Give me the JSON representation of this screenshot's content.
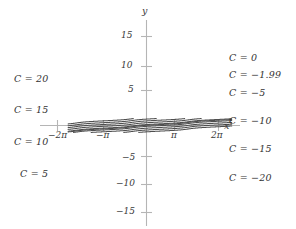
{
  "figure": {
    "axis_name_x": "x",
    "axis_name_y": "y",
    "axis_color": "#b0b0b0",
    "curve_color": "#4a4a4a",
    "background": "#ffffff"
  },
  "chart_data": {
    "type": "line",
    "title": "",
    "xlabel": "x",
    "ylabel": "y",
    "grid": false,
    "legend": "inline-curve-labels",
    "xlim": [
      -8.6,
      9.4
    ],
    "ylim": [
      -17.5,
      17.5
    ],
    "xticks": [
      -6.2832,
      -3.1416,
      3.1416,
      6.2832
    ],
    "xticklabels": [
      "−2π",
      "−π",
      "π",
      "2π"
    ],
    "yticks": [
      15,
      10,
      5,
      -5,
      -10,
      -15
    ],
    "yticklabels": [
      "15",
      "10",
      "5",
      "−5",
      "−10",
      "−15"
    ],
    "series": [
      {
        "name": "C = 20",
        "C": 20,
        "label": "C = 20",
        "label_side": "left"
      },
      {
        "name": "C = 15",
        "C": 15,
        "label": "C = 15",
        "label_side": "left"
      },
      {
        "name": "C = 10",
        "C": 10,
        "label": "C = 10",
        "label_side": "left"
      },
      {
        "name": "C = 5",
        "C": 5,
        "label": "C = 5",
        "label_side": "left"
      },
      {
        "name": "C = 0",
        "C": 0,
        "label": "C = 0",
        "label_side": "right"
      },
      {
        "name": "C = -1.99",
        "C": -1.99,
        "label": "C = −1.99",
        "label_side": "right"
      },
      {
        "name": "C = -5",
        "C": -5,
        "label": "C = −5",
        "label_side": "right"
      },
      {
        "name": "C = -10",
        "C": -10,
        "label": "C = −10",
        "label_side": "right"
      },
      {
        "name": "C = -15",
        "C": -15,
        "label": "C = −15",
        "label_side": "right"
      },
      {
        "name": "C = -20",
        "C": -20,
        "label": "C = −20",
        "label_side": "right"
      }
    ]
  },
  "labels": {
    "left": [
      {
        "text": "C = 20",
        "x": 14,
        "y": 73
      },
      {
        "text": "C = 15",
        "x": 14,
        "y": 104
      },
      {
        "text": "C = 10",
        "x": 14,
        "y": 136
      },
      {
        "text": "C = 5",
        "x": 20,
        "y": 168
      }
    ],
    "right": [
      {
        "text": "C = 0",
        "x": 229,
        "y": 52
      },
      {
        "text": "C = −1.99",
        "x": 229,
        "y": 69
      },
      {
        "text": "C = −5",
        "x": 229,
        "y": 87
      },
      {
        "text": "C = −10",
        "x": 229,
        "y": 115
      },
      {
        "text": "C = −15",
        "x": 229,
        "y": 143
      },
      {
        "text": "C = −20",
        "x": 229,
        "y": 172
      }
    ],
    "xticks": [
      {
        "text": "−2π",
        "x": 48,
        "y": 130
      },
      {
        "text": "−π",
        "x": 96,
        "y": 130
      },
      {
        "text": "π",
        "x": 171,
        "y": 130
      },
      {
        "text": "2π",
        "x": 211,
        "y": 130
      }
    ],
    "yticks": [
      {
        "text": "15",
        "x": 121,
        "y": 30
      },
      {
        "text": "10",
        "x": 121,
        "y": 60
      },
      {
        "text": "5",
        "x": 128,
        "y": 84
      },
      {
        "text": "−5",
        "x": 122,
        "y": 152
      },
      {
        "text": "−10",
        "x": 116,
        "y": 178
      },
      {
        "text": "−15",
        "x": 116,
        "y": 206
      }
    ],
    "axis_x": {
      "text": "x",
      "x": 224,
      "y": 120
    },
    "axis_y": {
      "text": "y",
      "x": 142,
      "y": 5
    }
  }
}
